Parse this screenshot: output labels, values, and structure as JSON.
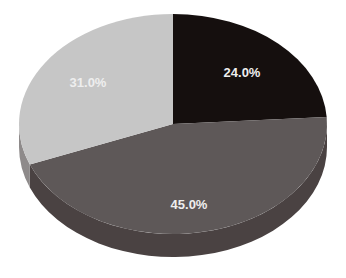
{
  "chart_data": {
    "type": "pie",
    "style": "3d",
    "title": "",
    "categories": [
      "Slice A",
      "Slice B",
      "Slice C"
    ],
    "values": [
      24.0,
      45.0,
      31.0
    ],
    "labels": [
      "24.0%",
      "45.0%",
      "31.0%"
    ],
    "colors": [
      "#150f0e",
      "#5e5858",
      "#c6c6c6"
    ],
    "side_colors": [
      "#0d0909",
      "#4a4242",
      "#8e8a8a"
    ],
    "start_angle_deg": 0,
    "direction": "clockwise",
    "legend": "none"
  }
}
